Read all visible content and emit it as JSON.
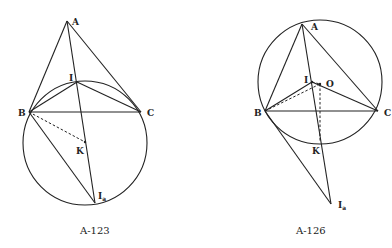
{
  "figures": [
    {
      "caption": "A-123",
      "labels": {
        "A": "A",
        "I": "I",
        "B": "B",
        "C": "C",
        "K": "K",
        "Ia": "I",
        "Ia_sub": "a"
      },
      "points": {
        "A": [
          67,
          21
        ],
        "I": [
          77,
          82
        ],
        "B": [
          29,
          112
        ],
        "C": [
          141,
          112
        ],
        "K": [
          85,
          142
        ],
        "Ia": [
          95,
          203
        ]
      },
      "circle": {
        "cx": 85,
        "cy": 142,
        "r": 62
      }
    },
    {
      "caption": "A-126",
      "labels": {
        "A": "A",
        "I": "I",
        "O": "O",
        "B": "B",
        "C": "C",
        "K": "K",
        "Ia": "I",
        "Ia_sub": "a"
      },
      "points": {
        "A": [
          302,
          24
        ],
        "I": [
          312,
          82
        ],
        "O": [
          320,
          84
        ],
        "B": [
          265,
          111
        ],
        "C": [
          378,
          111
        ],
        "K": [
          320,
          142
        ],
        "Ia": [
          331,
          204
        ]
      },
      "circle": {
        "cx": 320,
        "cy": 83,
        "r": 62
      }
    }
  ]
}
